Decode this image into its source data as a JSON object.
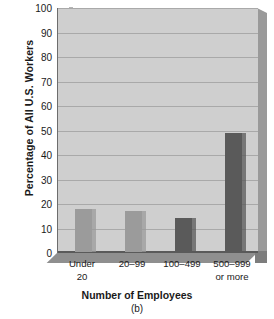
{
  "chart_data": {
    "type": "bar",
    "title": "",
    "caption": "(b)",
    "xlabel": "Number of Employees",
    "ylabel": "Percentage of All U.S. Workers",
    "categories": [
      "Under 20",
      "20–99",
      "100–499",
      "500–999 or more"
    ],
    "category_lines": [
      {
        "line1": "Under",
        "line2": "20"
      },
      {
        "line1": "20–99",
        "line2": ""
      },
      {
        "line1": "100–499",
        "line2": ""
      },
      {
        "line1": "500–999",
        "line2": "or more"
      }
    ],
    "values": [
      17.7,
      16.9,
      14.0,
      48.5
    ],
    "ylim": [
      0,
      100
    ],
    "yticks": [
      0,
      10,
      20,
      30,
      40,
      50,
      60,
      70,
      80,
      90,
      100
    ],
    "ytick_labels": [
      "0",
      "10",
      "20",
      "30",
      "40",
      "50",
      "60",
      "70",
      "80",
      "90",
      "100"
    ],
    "grid": true,
    "legend": "none",
    "bar_colors": [
      "#9b9b9b",
      "#9b9b9b",
      "#5a5a5a",
      "#5a5a5a"
    ]
  },
  "colors": {
    "plot_background": "#cfcfcf",
    "gridline": "#a9a9a9",
    "axis": "#5a5a5a",
    "bar_light": "#9b9b9b",
    "bar_dark": "#5a5a5a",
    "side_3d": "#9a9a9a",
    "floor_3d": "#8f8f8f",
    "text": "#1a1a1a",
    "page_background": "#ffffff"
  }
}
